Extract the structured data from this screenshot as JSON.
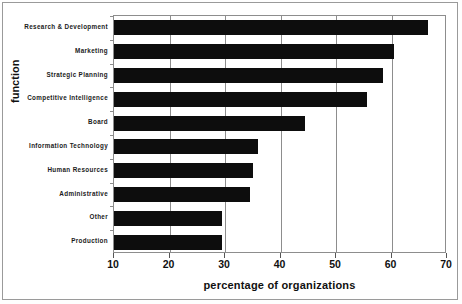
{
  "chart_data": {
    "type": "bar",
    "orientation": "horizontal",
    "title": "",
    "xlabel": "percentage of organizations",
    "ylabel": "function",
    "xlim": [
      10,
      70
    ],
    "ylim": null,
    "grid": true,
    "legend": null,
    "xticks": [
      10,
      20,
      30,
      40,
      50,
      60,
      70
    ],
    "categories": [
      "Research & Development",
      "Marketing",
      "Strategic Planning",
      "Competitive Intelligence",
      "Board",
      "Information Technology",
      "Human Resources",
      "Administrative",
      "Other",
      "Production"
    ],
    "values": [
      66.5,
      60.5,
      58.5,
      55.5,
      44.5,
      36,
      35,
      34.5,
      29.5,
      29.5
    ],
    "bar_color": "#0d0d0d"
  },
  "axes": {
    "x_tick_labels": [
      "10",
      "20",
      "30",
      "40",
      "50",
      "60",
      "70"
    ],
    "x_title": "percentage of organizations",
    "y_title": "function"
  }
}
